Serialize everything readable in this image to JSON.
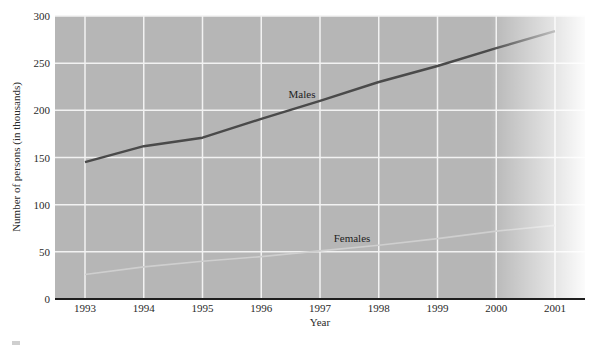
{
  "chart_data": {
    "type": "line",
    "title": "",
    "xlabel": "Year",
    "ylabel": "Number of persons (in thousands)",
    "ylim": [
      0,
      300
    ],
    "yticks": [
      0,
      50,
      100,
      150,
      200,
      250,
      300
    ],
    "x": [
      1993,
      1994,
      1995,
      1996,
      1997,
      1998,
      1999,
      2000,
      2001
    ],
    "grid": true,
    "legend": "inline labels",
    "series": [
      {
        "name": "Males",
        "color": "#4a4a4a",
        "values": [
          145,
          162,
          171,
          191,
          210,
          230,
          247,
          266,
          284
        ]
      },
      {
        "name": "Females",
        "color": "#cfcfcf",
        "values": [
          26,
          34,
          40,
          45,
          51,
          57,
          64,
          72,
          78
        ]
      }
    ]
  },
  "labels": {
    "males": "Males",
    "females": "Females",
    "xlabel": "Year",
    "ylabel": "Number of persons (in thousands)"
  },
  "colors": {
    "plot_bg": "#b6b6b6",
    "grid": "#f2f2f2",
    "axis": "#1e1e1e"
  }
}
